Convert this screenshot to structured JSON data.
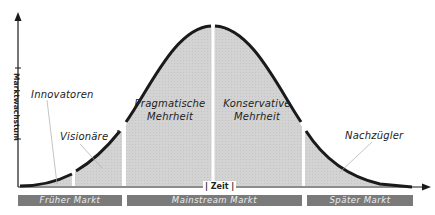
{
  "diagram": {
    "type": "technology-adoption-life-cycle",
    "y_axis_label": "Marktwachstum",
    "x_axis_label": "Zeit",
    "segments": [
      {
        "label": "Innovatoren"
      },
      {
        "label": "Visionäre"
      },
      {
        "label_line1": "Pragmatische",
        "label_line2": "Mehrheit"
      },
      {
        "label_line1": "Konservative",
        "label_line2": "Mehrheit"
      },
      {
        "label": "Nachzügler"
      }
    ],
    "markets": [
      {
        "label": "Früher Markt"
      },
      {
        "label": "Mainstream Markt"
      },
      {
        "label": "Später Markt"
      }
    ],
    "colors": {
      "fill": "#d3d3d3",
      "curve": "#1a1a1a",
      "market_bar": "#7a7a7a",
      "market_text": "#eeeeee"
    }
  }
}
